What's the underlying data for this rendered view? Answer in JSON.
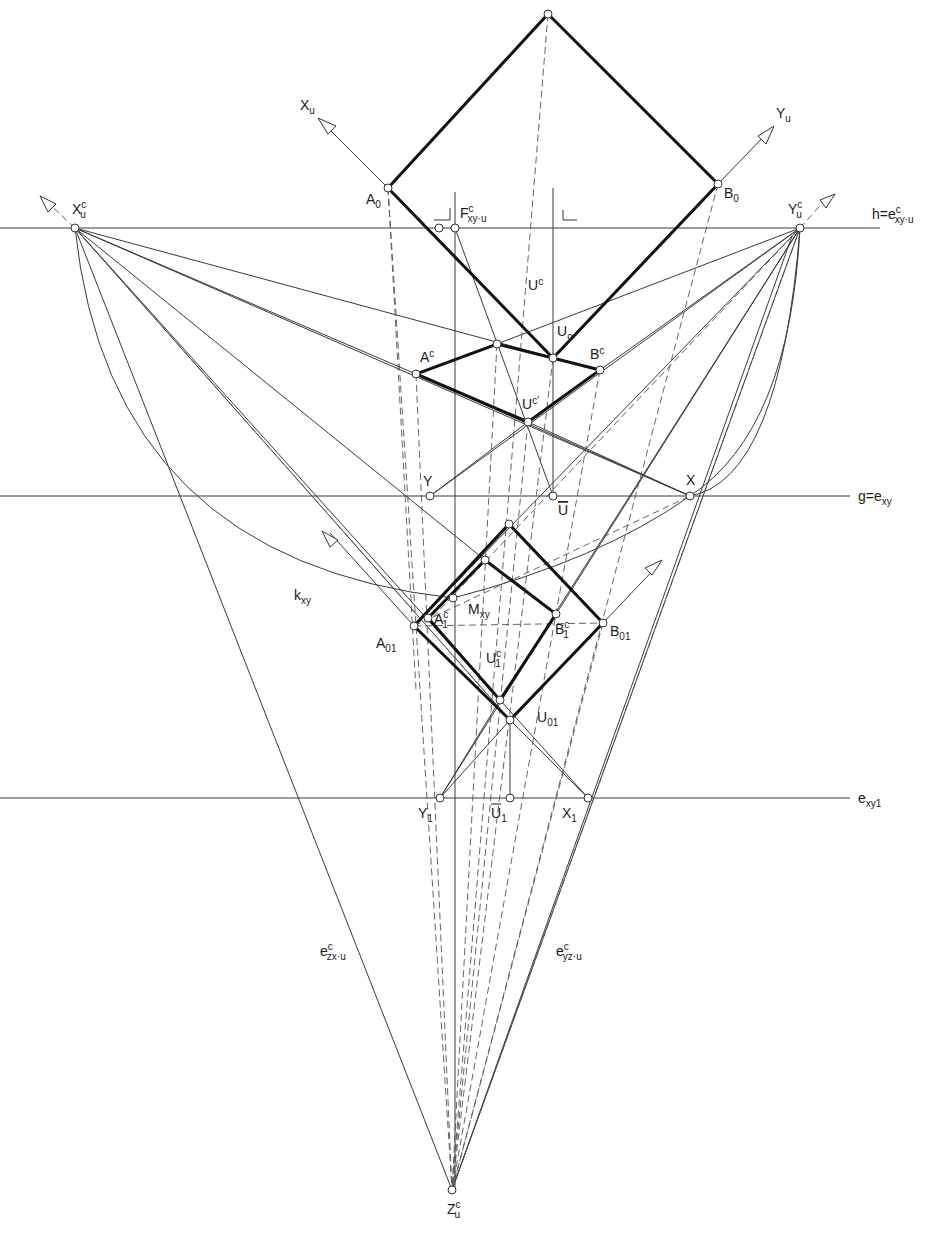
{
  "figure": {
    "type": "descriptive-geometry perspective construction",
    "lines": {
      "horizon": {
        "label_main": "h=e",
        "label_sup": "c",
        "label_sub": "xy·u",
        "y": 228
      },
      "ground": {
        "label_main": "g=e",
        "label_sub": "xy",
        "y": 496
      },
      "plane1": {
        "label_main": "e",
        "label_sub": "xy1",
        "y": 798
      }
    },
    "points": {
      "Xuc": {
        "main": "X",
        "sup": "c",
        "sub": "u"
      },
      "Yuc": {
        "main": "Y",
        "sup": "c",
        "sub": "u"
      },
      "Zuc": {
        "main": "Z",
        "sup": "c",
        "sub": "u"
      },
      "Xu": {
        "main": "X",
        "sub": "u"
      },
      "Yu": {
        "main": "Y",
        "sub": "u"
      },
      "A0": {
        "main": "A",
        "sub": "0"
      },
      "B0": {
        "main": "B",
        "sub": "0"
      },
      "Fxyuc": {
        "main": "F",
        "sup": "c",
        "sub": "xy·u"
      },
      "Uc_top": {
        "main": "U",
        "sup": "c"
      },
      "U0": {
        "main": "U",
        "sub": "o"
      },
      "Ac": {
        "main": "A",
        "sup": "c"
      },
      "Bc": {
        "main": "B",
        "sup": "c"
      },
      "Ucp": {
        "main": "U",
        "sup": "c'"
      },
      "Y": {
        "main": "Y"
      },
      "X": {
        "main": "X"
      },
      "Ubar": {
        "main": "U"
      },
      "kxy": {
        "main": "k",
        "sub": "xy"
      },
      "A01": {
        "main": "A",
        "sub": "01"
      },
      "A1c": {
        "main": "A",
        "sup": "c",
        "sub": "1"
      },
      "Mxy": {
        "main": "M",
        "sub": "xy"
      },
      "B1c": {
        "main": "B",
        "sup": "c",
        "sub": "1"
      },
      "B01": {
        "main": "B",
        "sub": "01"
      },
      "U1c": {
        "main": "U",
        "sup": "c",
        "sub": "1"
      },
      "U01": {
        "main": "U",
        "sub": "01"
      },
      "Y1": {
        "main": "Y",
        "sub": "1"
      },
      "U1bar": {
        "main": "U",
        "sub": "1"
      },
      "X1": {
        "main": "X",
        "sub": "1"
      },
      "ezxu": {
        "main": "e",
        "sup": "c",
        "sub": "zx·u"
      },
      "eyzu": {
        "main": "e",
        "sup": "c",
        "sub": "yz·u"
      }
    }
  }
}
